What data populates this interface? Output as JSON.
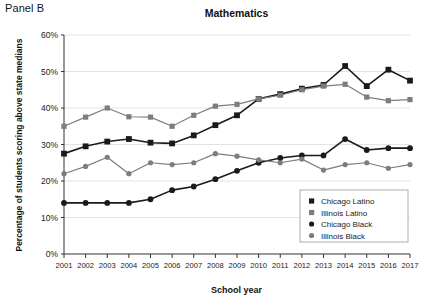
{
  "panel": {
    "label": "Panel B"
  },
  "chart_data": {
    "type": "line",
    "title": "Mathematics",
    "xlabel": "School year",
    "ylabel": "Percentage of students scoring above state medians",
    "xlim": [
      2001,
      2017
    ],
    "ylim": [
      0,
      60
    ],
    "grid": true,
    "legend_position": "bottom-right",
    "x": [
      2001,
      2002,
      2003,
      2004,
      2005,
      2006,
      2007,
      2008,
      2009,
      2010,
      2011,
      2012,
      2013,
      2014,
      2015,
      2016,
      2017
    ],
    "categories": [
      "2001",
      "2002",
      "2003",
      "2004",
      "2005",
      "2006",
      "2007",
      "2008",
      "2009",
      "2010",
      "2011",
      "2012",
      "2013",
      "2014",
      "2015",
      "2016",
      "2017"
    ],
    "ytick_labels": [
      "0%",
      "10%",
      "20%",
      "30%",
      "40%",
      "50%",
      "60%"
    ],
    "ytick_values": [
      0,
      10,
      20,
      30,
      40,
      50,
      60
    ],
    "series": [
      {
        "name": "Chicago Latino",
        "marker": "square",
        "color": "#1a1a1a",
        "values": [
          27.5,
          29.5,
          30.8,
          31.5,
          30.5,
          30.3,
          32.5,
          35.3,
          38.0,
          42.5,
          43.8,
          45.3,
          46.3,
          51.5,
          46.0,
          50.5,
          47.5
        ]
      },
      {
        "name": "Illinois Latino",
        "marker": "square",
        "color": "#7d7d7d",
        "values": [
          35.0,
          37.5,
          40.0,
          37.6,
          37.5,
          35.0,
          38.0,
          40.5,
          41.0,
          42.5,
          43.5,
          45.0,
          46.0,
          46.5,
          43.0,
          42.0,
          42.3
        ]
      },
      {
        "name": "Chicago Black",
        "marker": "circle",
        "color": "#1a1a1a",
        "values": [
          14.0,
          14.0,
          14.0,
          14.0,
          15.0,
          17.5,
          18.5,
          20.5,
          22.8,
          25.0,
          26.3,
          27.0,
          27.0,
          31.5,
          28.5,
          29.0,
          29.0
        ]
      },
      {
        "name": "Illinois Black",
        "marker": "circle",
        "color": "#7d7d7d",
        "values": [
          22.0,
          24.0,
          26.5,
          22.0,
          25.0,
          24.5,
          25.0,
          27.5,
          26.8,
          25.8,
          25.0,
          26.0,
          23.0,
          24.5,
          25.0,
          23.5,
          24.5
        ]
      }
    ]
  }
}
